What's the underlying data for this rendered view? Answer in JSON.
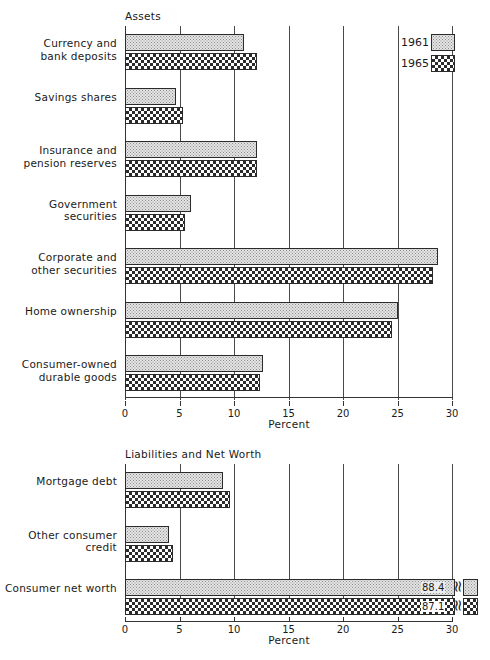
{
  "figure": {
    "legend": {
      "entries": [
        {
          "label": "1961",
          "pattern": "stipple"
        },
        {
          "label": "1965",
          "pattern": "crosshatch"
        }
      ]
    }
  },
  "chart_data": [
    {
      "type": "bar",
      "orientation": "horizontal",
      "title": "Assets",
      "xlabel": "Percent",
      "ylabel": "",
      "xlim": [
        0,
        30
      ],
      "xticks": [
        0,
        5,
        10,
        15,
        20,
        25,
        30
      ],
      "xticklabels": [
        "0",
        "5",
        "10",
        "15",
        "20",
        "25",
        "30"
      ],
      "grid": true,
      "legend_position": "top-right",
      "categories": [
        "Currency and\nbank deposits",
        "Savings shares",
        "Insurance and\npension reserves",
        "Government securities",
        "Corporate and\nother securities",
        "Home ownership",
        "Consumer-owned\ndurable goods"
      ],
      "series": [
        {
          "name": "1961",
          "values": [
            10.9,
            4.7,
            12.1,
            6.1,
            28.7,
            25.0,
            12.7
          ]
        },
        {
          "name": "1965",
          "values": [
            12.1,
            5.3,
            12.1,
            5.5,
            28.3,
            24.5,
            12.4
          ]
        }
      ]
    },
    {
      "type": "bar",
      "orientation": "horizontal",
      "title": "Liabilities and Net Worth",
      "xlabel": "Percent",
      "ylabel": "",
      "xlim": [
        0,
        30
      ],
      "xticks": [
        0,
        5,
        10,
        15,
        20,
        25,
        30
      ],
      "xticklabels": [
        "0",
        "5",
        "10",
        "15",
        "20",
        "25",
        "30"
      ],
      "grid": true,
      "broken_axis": true,
      "categories": [
        "Mortgage debt",
        "Other consumer\ncredit",
        "Consumer net worth"
      ],
      "series": [
        {
          "name": "1961",
          "values": [
            9.0,
            4.0,
            88.4
          ]
        },
        {
          "name": "1965",
          "values": [
            9.6,
            4.4,
            87.1
          ]
        }
      ],
      "data_labels": [
        {
          "category": "Consumer net worth",
          "series": "1961",
          "text": "88.4"
        },
        {
          "category": "Consumer net worth",
          "series": "1965",
          "text": "87.1"
        }
      ]
    }
  ]
}
